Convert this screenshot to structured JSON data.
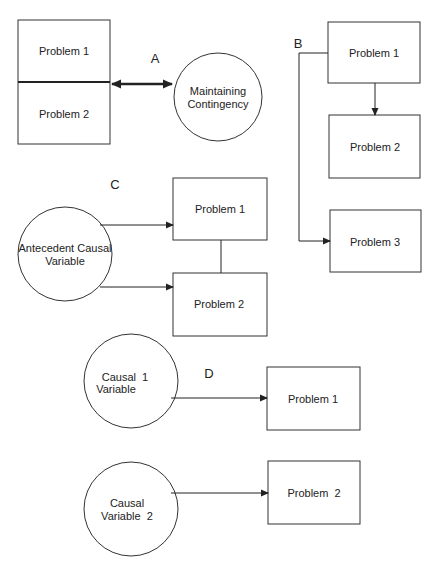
{
  "diagram": {
    "panels": {
      "A": {
        "label": "A",
        "boxes": [
          "Problem 1",
          "Problem 2"
        ],
        "circle": [
          "Maintaining",
          "Contingency"
        ],
        "edges": [
          {
            "from": "Problem 1/Problem 2",
            "to": "Maintaining Contingency",
            "type": "bidirectional"
          }
        ]
      },
      "B": {
        "label": "B",
        "boxes": [
          "Problem 1",
          "Problem 2",
          "Problem 3"
        ],
        "edges": [
          {
            "from": "Problem 1",
            "to": "Problem 2",
            "type": "arrow"
          },
          {
            "from": "Problem 1",
            "to": "Problem 3",
            "type": "arrow"
          }
        ]
      },
      "C": {
        "label": "C",
        "circle": [
          "Antecedent Causal",
          "Variable"
        ],
        "boxes": [
          "Problem 1",
          "Problem 2"
        ],
        "edges": [
          {
            "from": "Antecedent Causal Variable",
            "to": "Problem 1",
            "type": "arrow"
          },
          {
            "from": "Antecedent Causal Variable",
            "to": "Problem 2",
            "type": "arrow"
          },
          {
            "from": "Problem 1",
            "to": "Problem 2",
            "type": "line"
          }
        ]
      },
      "D": {
        "label": "D",
        "circles": [
          [
            "Causal  1",
            "Variable"
          ],
          [
            "Causal",
            "Variable  2"
          ]
        ],
        "boxes": [
          "Problem 1",
          "Problem  2"
        ],
        "edges": [
          {
            "from": "Causal 1 Variable",
            "to": "Problem 1",
            "type": "arrow"
          },
          {
            "from": "Causal Variable 2",
            "to": "Problem 2",
            "type": "arrow"
          }
        ]
      }
    }
  }
}
